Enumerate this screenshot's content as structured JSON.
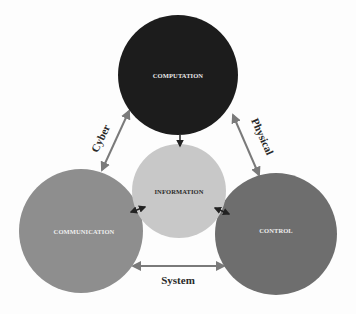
{
  "diagram": {
    "nodes": [
      {
        "id": "computation",
        "label": "COMPUTATION",
        "color": "#1c1c1c",
        "text_color": "#e8e8e8"
      },
      {
        "id": "communication",
        "label": "COMMUNICATION",
        "color": "#8e8e8e",
        "text_color": "#eeeeee"
      },
      {
        "id": "control",
        "label": "CONTROL",
        "color": "#6e6e6e",
        "text_color": "#eeeeee"
      },
      {
        "id": "information",
        "label": "INFORMATION",
        "color": "#c8c8c8",
        "text_color": "#2a2a2a"
      }
    ],
    "edges": [
      {
        "from": "computation",
        "to": "communication",
        "label": "Cyber",
        "bidirectional": true
      },
      {
        "from": "computation",
        "to": "control",
        "label": "Physical",
        "bidirectional": true
      },
      {
        "from": "communication",
        "to": "control",
        "label": "System",
        "bidirectional": true
      },
      {
        "from": "computation",
        "to": "information",
        "label": "",
        "bidirectional": false
      },
      {
        "from": "communication",
        "to": "information",
        "label": "",
        "bidirectional": true
      },
      {
        "from": "control",
        "to": "information",
        "label": "",
        "bidirectional": true
      }
    ]
  }
}
